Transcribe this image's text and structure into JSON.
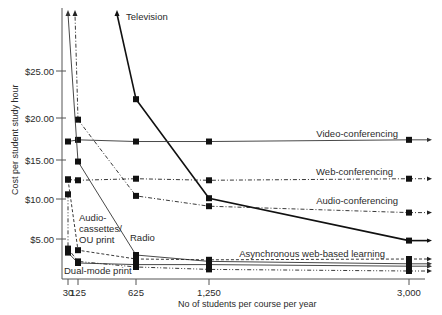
{
  "chart_data": {
    "type": "line",
    "title": "",
    "xlabel": "No of students per course per year",
    "ylabel": "Cost per student study hour",
    "x_ticks": [
      30,
      125,
      625,
      1250,
      3000
    ],
    "x_tick_labels": [
      "30",
      "125",
      "625",
      "1,250",
      "3,000"
    ],
    "y_ticks": [
      5,
      10,
      15,
      20,
      25
    ],
    "y_tick_labels": [
      "$5.00",
      "$10.00",
      "$15.00",
      "$20.00",
      "$25.00"
    ],
    "ylim": [
      0,
      30
    ],
    "grid": false,
    "legend": "inline labels",
    "series": [
      {
        "name": "Television",
        "label": "Television",
        "style": "solid-bold",
        "points": [
          [
            625,
            22.0
          ],
          [
            1250,
            10.1
          ],
          [
            3000,
            4.8
          ]
        ],
        "arrow_up_from": 625,
        "arrow_right": true
      },
      {
        "name": "Video-conferencing",
        "label": "Video-conferencing",
        "style": "solid-thin",
        "points": [
          [
            30,
            17.2
          ],
          [
            125,
            17.4
          ],
          [
            625,
            17.2
          ],
          [
            1250,
            17.2
          ],
          [
            3000,
            17.4
          ]
        ],
        "arrow_right": true
      },
      {
        "name": "Web-conferencing",
        "label": "Web-conferencing",
        "style": "dash-dot",
        "points": [
          [
            30,
            12.5
          ],
          [
            125,
            12.4
          ],
          [
            625,
            12.6
          ],
          [
            1250,
            12.4
          ],
          [
            3000,
            12.6
          ]
        ],
        "arrow_right": true
      },
      {
        "name": "Audio-conferencing",
        "label": "Audio-conferencing",
        "style": "dash-dot",
        "points": [
          [
            125,
            19.8
          ],
          [
            625,
            10.4
          ],
          [
            1250,
            9.1
          ],
          [
            3000,
            8.3
          ]
        ],
        "arrow_up_from": 125,
        "arrow_right": true
      },
      {
        "name": "Radio",
        "label": "Radio",
        "style": "solid-thin",
        "points": [
          [
            125,
            14.8
          ],
          [
            625,
            3.0
          ],
          [
            1250,
            2.2
          ],
          [
            3000,
            1.9
          ]
        ],
        "arrow_up_from": 125,
        "arrow_right": true
      },
      {
        "name": "Audio-cassettes/OU print",
        "label": "Audio-\ncassettes/\nOU print",
        "style": "dash-dot-dot",
        "points": [
          [
            30,
            10.6
          ],
          [
            30,
            3.8
          ],
          [
            125,
            2.2
          ],
          [
            625,
            1.5
          ],
          [
            1250,
            1.2
          ],
          [
            3000,
            1.0
          ]
        ],
        "arrow_right": true
      },
      {
        "name": "Asynchronous web-based learning",
        "label": "Asynchronous web-based learning",
        "style": "dashed",
        "points": [
          [
            30,
            12.5
          ],
          [
            125,
            3.6
          ],
          [
            625,
            2.5
          ],
          [
            1250,
            2.4
          ],
          [
            3000,
            2.5
          ]
        ],
        "arrow_right": true
      },
      {
        "name": "Dual-mode print",
        "label": "Dual-mode print",
        "style": "solid-thin",
        "points": [
          [
            30,
            3.3
          ],
          [
            125,
            2.0
          ],
          [
            625,
            1.8
          ],
          [
            1250,
            1.8
          ],
          [
            3000,
            1.6
          ]
        ],
        "arrow_right": true
      }
    ]
  }
}
